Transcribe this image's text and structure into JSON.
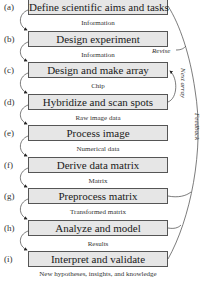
{
  "steps": [
    {
      "letter": "(a)",
      "label": "Define scientific aims and tasks",
      "output": "Information"
    },
    {
      "letter": "(b)",
      "label": "Design experiment",
      "output": "Information"
    },
    {
      "letter": "(c)",
      "label": "Design and make array",
      "output": "Chip"
    },
    {
      "letter": "(d)",
      "label": "Hybridize and scan spots",
      "output": "Raw image data"
    },
    {
      "letter": "(e)",
      "label": "Process image",
      "output": "Numerical data"
    },
    {
      "letter": "(f)",
      "label": "Derive data matrix",
      "output": "Matrix"
    },
    {
      "letter": "(g)",
      "label": "Preprocess matrix",
      "output": "Transformed matrix"
    },
    {
      "letter": "(h)",
      "label": "Analyze and model",
      "output": "Results"
    },
    {
      "letter": "(i)",
      "label": "Interpret and validate",
      "output": "New hypotheses, insights, and knowledge"
    }
  ],
  "side_labels": {
    "revise": "Revise",
    "next_array": "Next array",
    "feedback": "Feedback"
  },
  "colors": {
    "box_fill": "#e6e6e6",
    "box_border": "#555555",
    "line": "#444444"
  }
}
